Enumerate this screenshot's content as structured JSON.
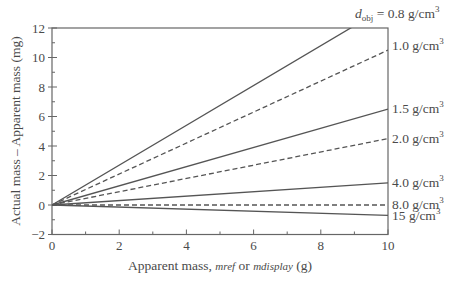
{
  "chart_data": {
    "type": "line",
    "title": "",
    "xlabel": "Apparent mass, m_ref or m_display (g)",
    "xlabel_parts": {
      "prefix": "Apparent mass, ",
      "var1": "mref",
      "mid": " or ",
      "var2": "mdisplay",
      "suffix": " (g)"
    },
    "ylabel": "Actual mass – Apparent mass (mg)",
    "xlim": [
      0,
      10
    ],
    "ylim": [
      -2,
      12
    ],
    "xticks": [
      0,
      2,
      4,
      6,
      8,
      10
    ],
    "yticks": [
      -2,
      0,
      2,
      4,
      6,
      8,
      10,
      12
    ],
    "grid": false,
    "legend_position": "inline-right",
    "x": [
      0,
      10
    ],
    "series": [
      {
        "name": "d_obj = 0.8 g/cm3",
        "label": "0.8 g/cm",
        "prefix": "d",
        "sub": "obj",
        "eq": " = ",
        "values": [
          0,
          13.5
        ],
        "style": "solid"
      },
      {
        "name": "1.0 g/cm3",
        "label": "1.0 g/cm",
        "values": [
          0,
          10.5
        ],
        "style": "dashed"
      },
      {
        "name": "1.5 g/cm3",
        "label": "1.5 g/cm",
        "values": [
          0,
          6.5
        ],
        "style": "solid"
      },
      {
        "name": "2.0 g/cm3",
        "label": "2.0 g/cm",
        "values": [
          0,
          4.5
        ],
        "style": "dashed"
      },
      {
        "name": "4.0 g/cm3",
        "label": "4.0 g/cm",
        "values": [
          0,
          1.5
        ],
        "style": "solid"
      },
      {
        "name": "8.0 g/cm3",
        "label": "8.0 g/cm",
        "values": [
          0,
          0.0
        ],
        "style": "dashed"
      },
      {
        "name": "15 g/cm3",
        "label": "15 g/cm",
        "values": [
          0,
          -0.7
        ],
        "style": "solid"
      }
    ],
    "colors": {
      "line": "#555555",
      "axis": "#666666",
      "text": "#4a4a4a"
    }
  }
}
